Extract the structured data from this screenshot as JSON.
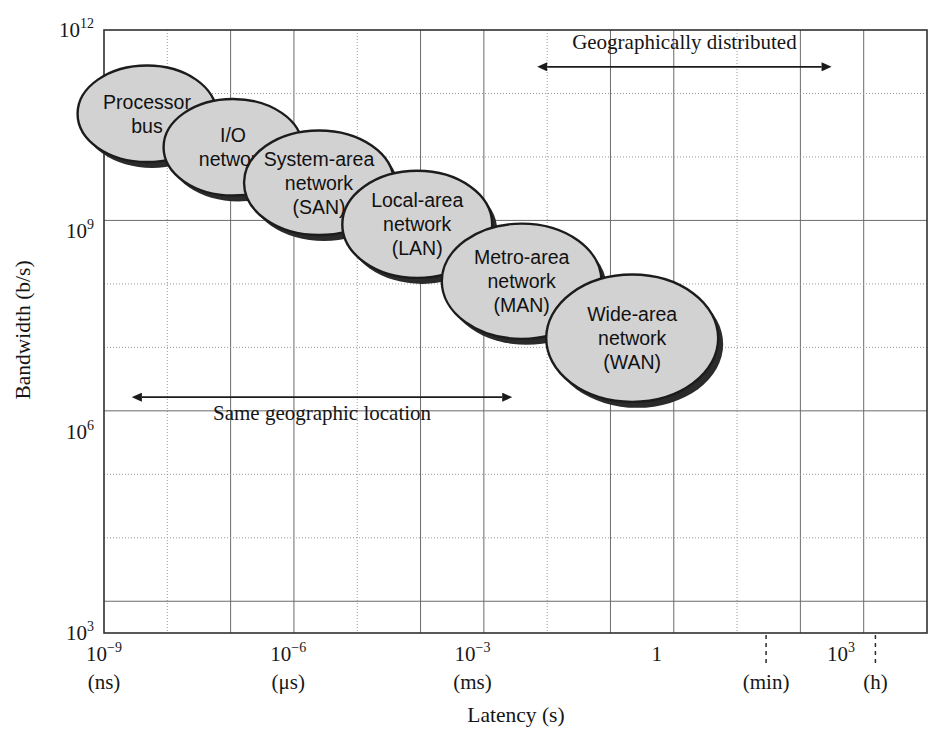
{
  "chart_data": {
    "type": "scatter",
    "title": "",
    "xlabel": "Latency (s)",
    "ylabel": "Bandwidth (b/s)",
    "xscale": "log",
    "yscale": "log",
    "xlim_exp": [
      -9,
      4.4
    ],
    "ylim_exp": [
      3,
      12
    ],
    "grid": true,
    "legend": "none",
    "x_tick_labels": [
      {
        "base": "10",
        "exp": "−9",
        "unit": "(ns)",
        "x_exp": -9
      },
      {
        "base": "10",
        "exp": "−6",
        "unit": "(μs)",
        "x_exp": -6
      },
      {
        "base": "10",
        "exp": "−3",
        "unit": "(ms)",
        "x_exp": -3
      },
      {
        "base": "1",
        "exp": "",
        "unit": "",
        "x_exp": 0
      },
      {
        "base": "",
        "exp": "",
        "unit": "(min)",
        "x_exp": 1.78
      },
      {
        "base": "10",
        "exp": "3",
        "unit": "",
        "x_exp": 3
      },
      {
        "base": "",
        "exp": "",
        "unit": "(h)",
        "x_exp": 3.56
      }
    ],
    "y_tick_labels": [
      {
        "base": "10",
        "exp": "12",
        "y_exp": 12
      },
      {
        "base": "10",
        "exp": "9",
        "y_exp": 9
      },
      {
        "base": "10",
        "exp": "6",
        "y_exp": 6
      },
      {
        "base": "10",
        "exp": "3",
        "y_exp": 3
      }
    ],
    "bubbles": [
      {
        "id": "processor-bus",
        "lines": [
          "Processor",
          "bus"
        ],
        "cx_exp": -8.3,
        "cy_exp": 10.75,
        "rx_exp": 1.13,
        "ry_exp": 0.72
      },
      {
        "id": "io-network",
        "lines": [
          "I/O",
          "network"
        ],
        "cx_exp": -6.9,
        "cy_exp": 10.25,
        "rx_exp": 1.13,
        "ry_exp": 0.72
      },
      {
        "id": "system-area-network",
        "lines": [
          "System-area",
          "network",
          "(SAN)"
        ],
        "cx_exp": -5.5,
        "cy_exp": 9.72,
        "rx_exp": 1.22,
        "ry_exp": 0.78
      },
      {
        "id": "local-area-network",
        "lines": [
          "Local-area",
          "network",
          "(LAN)"
        ],
        "cx_exp": -3.9,
        "cy_exp": 9.1,
        "rx_exp": 1.22,
        "ry_exp": 0.8
      },
      {
        "id": "metro-area-network",
        "lines": [
          "Metro-area",
          "network",
          "(MAN)"
        ],
        "cx_exp": -2.2,
        "cy_exp": 8.25,
        "rx_exp": 1.3,
        "ry_exp": 0.86
      },
      {
        "id": "wide-area-network",
        "lines": [
          "Wide-area",
          "network",
          "(WAN)"
        ],
        "cx_exp": -0.4,
        "cy_exp": 7.4,
        "rx_exp": 1.4,
        "ry_exp": 0.95
      }
    ],
    "annotations": [
      {
        "id": "geographically-distributed",
        "text": "Geographically distributed",
        "x0_exp": -1.8,
        "x1_exp": 2.7,
        "arrow_y_exp": 11.45,
        "text_y_exp": 11.72
      },
      {
        "id": "same-geographic-location",
        "text": "Same geographic location",
        "x0_exp": -8.4,
        "x1_exp": -2.5,
        "arrow_y_exp": 6.52,
        "text_y_exp": 6.18
      }
    ]
  },
  "colors": {
    "bubble_fill": "#d2d2d2",
    "bubble_stroke": "#1c1c1c",
    "bubble_shadow": "#2b2b2b",
    "grid_major": "#6b6b6b",
    "grid_minor": "#9a9a9a",
    "axis": "#303030",
    "text": "#151515",
    "background": "#ffffff"
  }
}
